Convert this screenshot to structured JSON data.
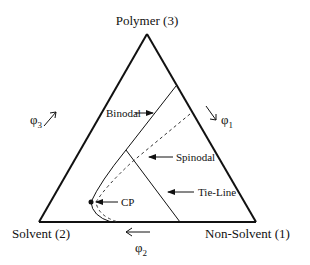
{
  "diagram": {
    "type": "ternary-phase-diagram",
    "vertices": {
      "top": "Polymer (3)",
      "left": "Solvent (2)",
      "right": "Non-Solvent (1)"
    },
    "axes": {
      "left_edge": {
        "symbol": "φ",
        "subscript": "3"
      },
      "right_edge": {
        "symbol": "φ",
        "subscript": "1"
      },
      "bottom_edge": {
        "symbol": "φ",
        "subscript": "2"
      }
    },
    "annotations": {
      "binodal": "Binodal",
      "spinodal": "Spinodal",
      "tie_line": "Tie-Line",
      "critical_point": "CP"
    },
    "colors": {
      "line": "#111111",
      "background": "#ffffff"
    }
  }
}
